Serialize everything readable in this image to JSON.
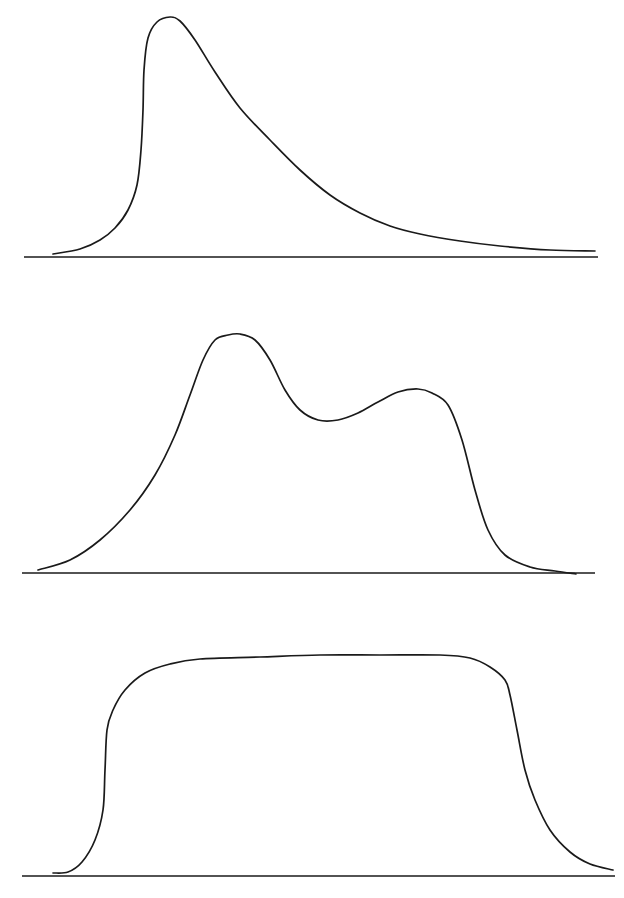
{
  "colors": {
    "background": "#ffffff",
    "stroke": "#1a1a1a"
  },
  "chart_data": [
    {
      "type": "line",
      "title": "",
      "xlabel": "",
      "ylabel": "",
      "description": "Right-skewed unimodal distribution: steep rise, sharp peak, long decaying right tail",
      "grid": false,
      "legend": null,
      "baseline": {
        "x1": 24,
        "x2": 598,
        "y": 257
      },
      "points": [
        [
          53,
          254
        ],
        [
          80,
          249
        ],
        [
          100,
          240
        ],
        [
          115,
          228
        ],
        [
          128,
          210
        ],
        [
          137,
          185
        ],
        [
          141,
          150
        ],
        [
          143,
          110
        ],
        [
          144,
          70
        ],
        [
          148,
          38
        ],
        [
          157,
          22
        ],
        [
          170,
          17
        ],
        [
          180,
          21
        ],
        [
          195,
          40
        ],
        [
          215,
          72
        ],
        [
          240,
          108
        ],
        [
          270,
          140
        ],
        [
          300,
          170
        ],
        [
          330,
          195
        ],
        [
          360,
          213
        ],
        [
          390,
          226
        ],
        [
          420,
          234
        ],
        [
          460,
          241
        ],
        [
          500,
          246
        ],
        [
          550,
          250
        ],
        [
          595,
          251
        ]
      ]
    },
    {
      "type": "line",
      "title": "",
      "xlabel": "",
      "ylabel": "",
      "description": "Bimodal distribution: taller left peak, shallow valley, lower right peak, steep right fall-off",
      "grid": false,
      "legend": null,
      "baseline": {
        "x1": 22,
        "x2": 595,
        "y": 573
      },
      "points": [
        [
          38,
          570
        ],
        [
          70,
          560
        ],
        [
          100,
          540
        ],
        [
          130,
          510
        ],
        [
          155,
          475
        ],
        [
          175,
          435
        ],
        [
          190,
          395
        ],
        [
          203,
          360
        ],
        [
          215,
          340
        ],
        [
          228,
          335
        ],
        [
          240,
          334
        ],
        [
          255,
          340
        ],
        [
          270,
          360
        ],
        [
          285,
          390
        ],
        [
          300,
          410
        ],
        [
          318,
          420
        ],
        [
          338,
          420
        ],
        [
          358,
          413
        ],
        [
          378,
          402
        ],
        [
          398,
          392
        ],
        [
          418,
          389
        ],
        [
          432,
          393
        ],
        [
          448,
          405
        ],
        [
          462,
          440
        ],
        [
          475,
          490
        ],
        [
          488,
          530
        ],
        [
          505,
          555
        ],
        [
          530,
          567
        ],
        [
          555,
          571
        ],
        [
          576,
          574
        ]
      ]
    },
    {
      "type": "line",
      "title": "",
      "xlabel": "",
      "ylabel": "",
      "description": "Plateau-shaped distribution: steep rise, broad flat top, shoulder then steep right fall-off",
      "grid": false,
      "legend": null,
      "baseline": {
        "x1": 22,
        "x2": 615,
        "y": 876
      },
      "points": [
        [
          53,
          873
        ],
        [
          68,
          872
        ],
        [
          82,
          862
        ],
        [
          95,
          840
        ],
        [
          103,
          810
        ],
        [
          105,
          770
        ],
        [
          107,
          730
        ],
        [
          113,
          710
        ],
        [
          125,
          690
        ],
        [
          145,
          673
        ],
        [
          170,
          664
        ],
        [
          200,
          659
        ],
        [
          260,
          657
        ],
        [
          320,
          655
        ],
        [
          380,
          655
        ],
        [
          440,
          655
        ],
        [
          470,
          658
        ],
        [
          490,
          667
        ],
        [
          505,
          680
        ],
        [
          510,
          695
        ],
        [
          517,
          730
        ],
        [
          525,
          770
        ],
        [
          535,
          800
        ],
        [
          550,
          830
        ],
        [
          570,
          852
        ],
        [
          590,
          864
        ],
        [
          613,
          870
        ]
      ]
    }
  ]
}
